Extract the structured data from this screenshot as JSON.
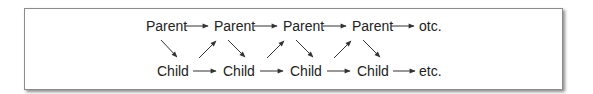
{
  "diagram": {
    "type": "flow",
    "parent_row": [
      "Parent",
      "Parent",
      "Parent",
      "Parent",
      "otc."
    ],
    "child_row": [
      "Child",
      "Child",
      "Child",
      "Child",
      "etc."
    ],
    "edges": [
      {
        "from": "parent-1",
        "to": "parent-2"
      },
      {
        "from": "parent-2",
        "to": "parent-3"
      },
      {
        "from": "parent-3",
        "to": "parent-4"
      },
      {
        "from": "parent-4",
        "to": "parent-etc"
      },
      {
        "from": "child-1",
        "to": "child-2"
      },
      {
        "from": "child-2",
        "to": "child-3"
      },
      {
        "from": "child-3",
        "to": "child-4"
      },
      {
        "from": "child-4",
        "to": "child-etc"
      },
      {
        "from": "parent-1",
        "to": "child-1"
      },
      {
        "from": "child-1",
        "to": "parent-2"
      },
      {
        "from": "parent-2",
        "to": "child-2"
      },
      {
        "from": "child-2",
        "to": "parent-3"
      },
      {
        "from": "parent-3",
        "to": "child-3"
      },
      {
        "from": "child-3",
        "to": "parent-4"
      },
      {
        "from": "parent-4",
        "to": "child-4"
      }
    ],
    "colors": {
      "text": "#222222",
      "arrow": "#333333",
      "border": "#8c8c8c"
    }
  }
}
